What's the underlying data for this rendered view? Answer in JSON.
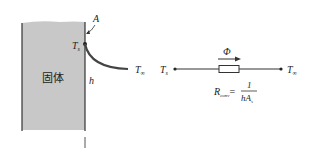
{
  "left_diagram": {
    "solid_label": "固体",
    "area_label": "A",
    "surface_temp_label": "T",
    "surface_temp_sub": "s",
    "coef_label": "h",
    "fluid_temp_label": "T",
    "fluid_temp_sub": "∞",
    "solid_fill": "#c8c8c8"
  },
  "right_diagram": {
    "flux_label": "Φ",
    "left_node_label": "T",
    "left_node_sub": "s",
    "right_node_label": "T",
    "right_node_sub": "∞",
    "resistance_label": "R",
    "resistance_sub": "conv",
    "equals": "=",
    "numerator": "1",
    "denominator": "hA",
    "denominator_sub": "s"
  }
}
